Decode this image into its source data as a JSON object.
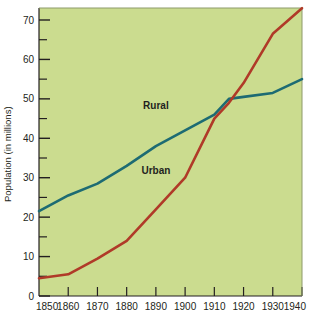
{
  "chart_data": {
    "type": "line",
    "title": "",
    "xlabel": "",
    "ylabel": "Population (in millions)",
    "xlim": [
      1850,
      1940
    ],
    "ylim": [
      0,
      75
    ],
    "grid": false,
    "legend_position": "inline-annotation",
    "x_ticks": [
      "1850",
      "1860",
      "1870",
      "1880",
      "1890",
      "1900",
      "1910",
      "1920",
      "1930",
      "1940"
    ],
    "y_ticks": [
      "0",
      "10",
      "20",
      "30",
      "40",
      "50",
      "60",
      "70"
    ],
    "y_minor_ticks": [
      5,
      15,
      25,
      35,
      45,
      55,
      65
    ],
    "x": [
      1850,
      1860,
      1870,
      1880,
      1890,
      1900,
      1910,
      1915,
      1920,
      1930,
      1940
    ],
    "series": [
      {
        "name": "Rural",
        "color": "#1d6b73",
        "values": [
          21.5,
          25.5,
          28.5,
          33.0,
          38.0,
          42.0,
          46.0,
          50.0,
          50.5,
          51.5,
          55.0
        ]
      },
      {
        "name": "Urban",
        "color": "#b03a28",
        "values": [
          4.5,
          5.5,
          9.5,
          14.0,
          22.0,
          30.0,
          45.0,
          49.0,
          54.0,
          66.5,
          73.0
        ]
      }
    ],
    "annotations": [
      {
        "text": "Rural",
        "x": 1890,
        "y": 47.5
      },
      {
        "text": "Urban",
        "x": 1890,
        "y": 31.0
      }
    ],
    "background_color": "#cbdc8f",
    "axis_color": "#231f20"
  },
  "axis": {
    "y_title": "Population (in millions)"
  }
}
